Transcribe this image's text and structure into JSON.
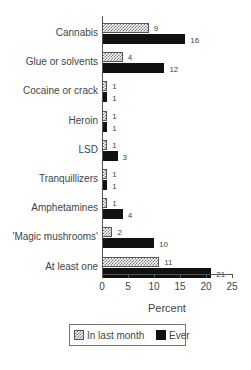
{
  "chart_data": {
    "type": "bar",
    "orientation": "horizontal",
    "title": "",
    "categories": [
      "Cannabis",
      "Glue or solvents",
      "Cocaine or crack",
      "Heroin",
      "LSD",
      "Tranquillizers",
      "Amphetamines",
      "'Magic mushrooms'",
      "At least one"
    ],
    "series": [
      {
        "name": "In last month",
        "values": [
          9,
          4,
          1,
          1,
          1,
          1,
          1,
          2,
          11
        ],
        "pattern": "crosshatch"
      },
      {
        "name": "Ever",
        "values": [
          16,
          12,
          1,
          1,
          3,
          1,
          4,
          10,
          21
        ],
        "color": "#111111"
      }
    ],
    "xlabel": "Percent",
    "ylabel": "",
    "xlim": [
      0,
      25
    ],
    "xticks": [
      "0",
      "5",
      "10",
      "15",
      "20",
      "25"
    ],
    "grid": false,
    "legend_position": "bottom"
  },
  "legend": {
    "month_label": "In last month",
    "ever_label": "Ever"
  },
  "axis": {
    "xlabel": "Percent",
    "ticks": [
      "0",
      "5",
      "10",
      "15",
      "20",
      "25"
    ]
  },
  "rows": [
    {
      "label": "Cannabis",
      "month": "9",
      "ever": "16"
    },
    {
      "label": "Glue or solvents",
      "month": "4",
      "ever": "12"
    },
    {
      "label": "Cocaine or crack",
      "month": "1",
      "ever": "1"
    },
    {
      "label": "Heroin",
      "month": "1",
      "ever": "1"
    },
    {
      "label": "LSD",
      "month": "1",
      "ever": "3"
    },
    {
      "label": "Tranquillizers",
      "month": "1",
      "ever": "1"
    },
    {
      "label": "Amphetamines",
      "month": "1",
      "ever": "4"
    },
    {
      "label": "'Magic mushrooms'",
      "month": "2",
      "ever": "10"
    },
    {
      "label": "At least one",
      "month": "11",
      "ever": "21"
    }
  ]
}
